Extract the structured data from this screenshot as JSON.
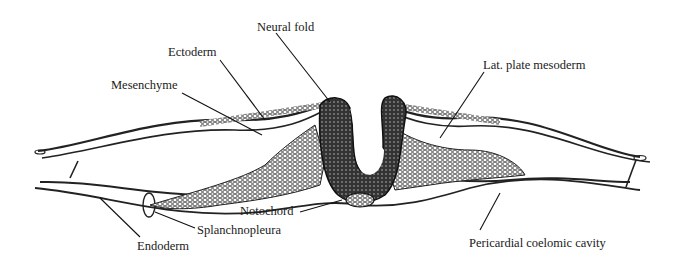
{
  "figure": {
    "labels": [
      {
        "id": "neural-fold",
        "text": "Neural fold",
        "x": 257,
        "y": 21
      },
      {
        "id": "ectoderm",
        "text": "Ectoderm",
        "x": 168,
        "y": 46
      },
      {
        "id": "mesenchyme",
        "text": "Mesenchyme",
        "x": 111,
        "y": 79
      },
      {
        "id": "lat-plate-mesoderm",
        "text": "Lat. plate mesoderm",
        "x": 483,
        "y": 59
      },
      {
        "id": "notochord",
        "text": "Notochord",
        "x": 240,
        "y": 205
      },
      {
        "id": "splanchnopleura",
        "text": "Splanchnopleura",
        "x": 197,
        "y": 224
      },
      {
        "id": "endoderm",
        "text": "Endoderm",
        "x": 137,
        "y": 240
      },
      {
        "id": "pericardial-coelomic-cavity",
        "text": "Pericardial coelomic cavity",
        "x": 469,
        "y": 237
      }
    ]
  }
}
